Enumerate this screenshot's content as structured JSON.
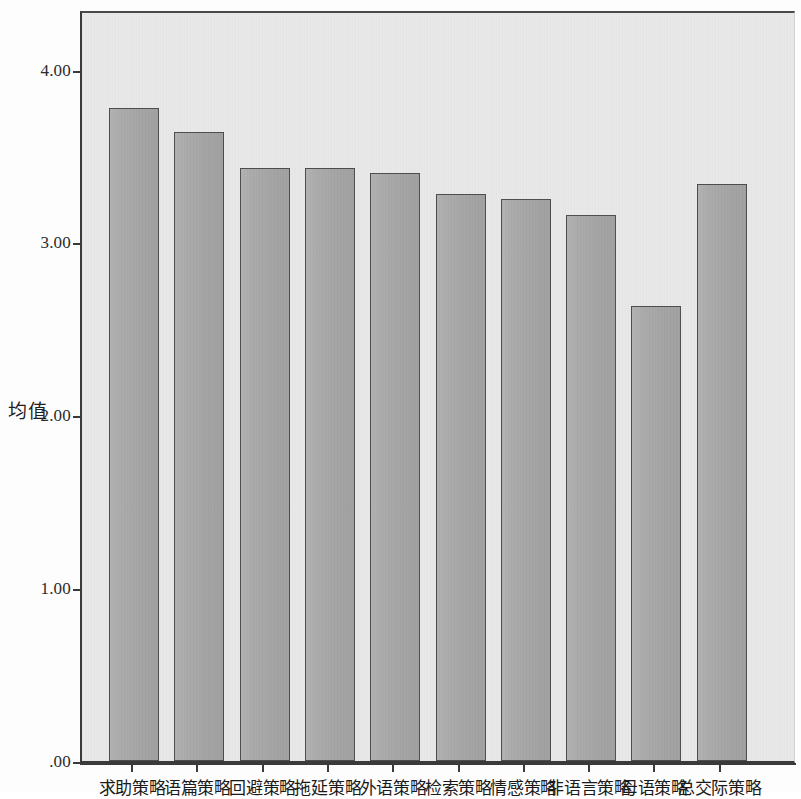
{
  "chart_data": {
    "type": "bar",
    "title": "",
    "xlabel": "",
    "ylabel": "均值",
    "ylim": [
      0,
      4.35
    ],
    "grid": false,
    "legend": "none",
    "y_ticks": [
      ".00",
      "1.00",
      "2.00",
      "3.00",
      "4.00"
    ],
    "y_tick_values": [
      0,
      1,
      2,
      3,
      4
    ],
    "categories": [
      "求助策略",
      "语篇策略",
      "回避策略",
      "拖延策略",
      "外语策略",
      "检索策略",
      "情感策略",
      "非语言策略",
      "母语策略",
      "总交际策略"
    ],
    "values": [
      3.78,
      3.64,
      3.43,
      3.43,
      3.4,
      3.28,
      3.25,
      3.16,
      2.63,
      3.34
    ],
    "bar_fill_color": "#a9a9a9",
    "bar_edge_color": "#4c4c4c",
    "panel_background": "#e9e9e9"
  },
  "ghost": {
    "line1": "的 研 究 结 果 表 明",
    "line2": "交 际 策 略 使 用",
    "line3": "学 习 者 水 平"
  }
}
